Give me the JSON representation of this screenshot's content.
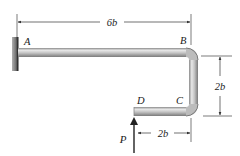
{
  "figure": {
    "type": "bent-bar-cantilever",
    "points": [
      {
        "id": "A",
        "label": "A"
      },
      {
        "id": "B",
        "label": "B"
      },
      {
        "id": "C",
        "label": "C"
      },
      {
        "id": "D",
        "label": "D"
      }
    ],
    "load": {
      "label": "P",
      "direction": "up",
      "applied_at": "D"
    },
    "dimensions": {
      "top_length": "6b",
      "vertical_drop": "2b",
      "bottom_length": "2b"
    },
    "colors": {
      "bar_light": "#e6e6e6",
      "bar_mid": "#b8b8b8",
      "bar_dark": "#7a7a7a",
      "wall": "#555555",
      "line": "#333333"
    }
  }
}
